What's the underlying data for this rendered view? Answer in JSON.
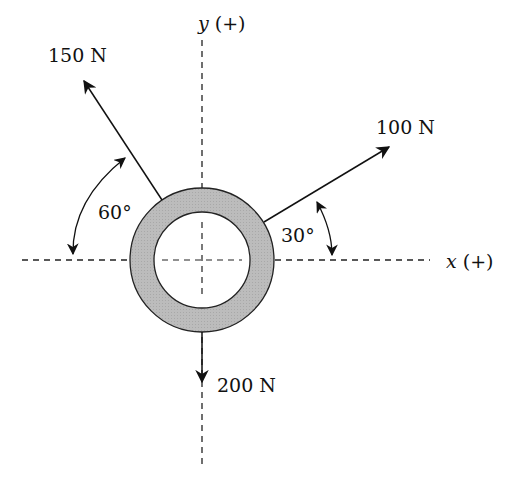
{
  "diagram": {
    "type": "free-body force diagram",
    "axes": {
      "x_label_var": "x",
      "x_label_sign": "(+)",
      "y_label_var": "y",
      "y_label_sign": "(+)"
    },
    "body": {
      "shape": "ring",
      "fill": "#bdbdbd"
    },
    "forces": [
      {
        "label": "150 N",
        "magnitude": 150,
        "unit": "N",
        "angle_label": "60°",
        "reference": "from negative x-axis (upper left)"
      },
      {
        "label": "100 N",
        "magnitude": 100,
        "unit": "N",
        "angle_label": "30°",
        "reference": "from positive x-axis (upper right)"
      },
      {
        "label": "200 N",
        "magnitude": 200,
        "unit": "N",
        "direction": "straight down (negative y)"
      }
    ]
  }
}
